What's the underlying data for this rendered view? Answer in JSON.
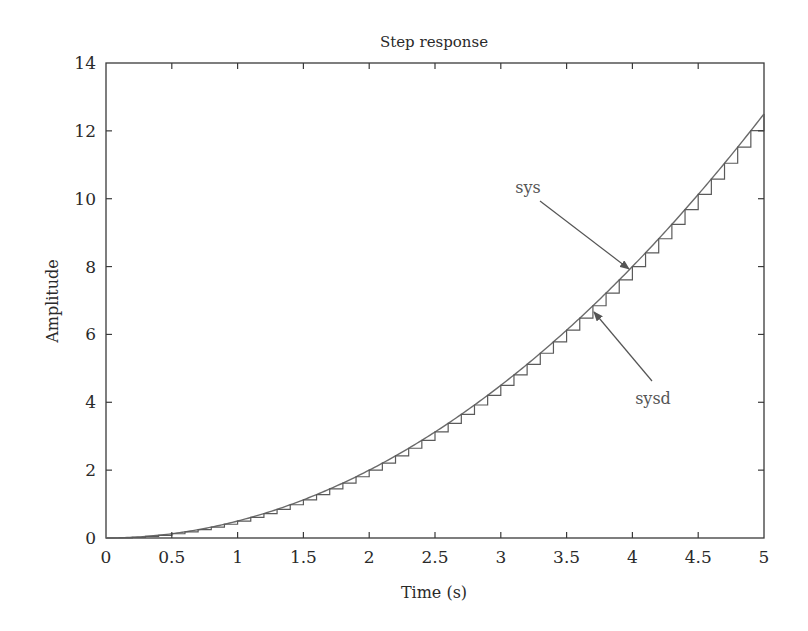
{
  "chart_data": {
    "type": "line",
    "title": "Step response",
    "xlabel": "Time (s)",
    "ylabel": "Amplitude",
    "xlim": [
      0,
      5
    ],
    "ylim": [
      0,
      14
    ],
    "xticks": [
      0,
      0.5,
      1,
      1.5,
      2,
      2.5,
      3,
      3.5,
      4,
      4.5,
      5
    ],
    "xtick_labels": [
      "0",
      "0.5",
      "1",
      "1.5",
      "2",
      "2.5",
      "3",
      "3.5",
      "4",
      "4.5",
      "5"
    ],
    "yticks": [
      0,
      2,
      4,
      6,
      8,
      10,
      12,
      14
    ],
    "ytick_labels": [
      "0",
      "2",
      "4",
      "6",
      "8",
      "10",
      "12",
      "14"
    ],
    "grid": false,
    "legend": "none",
    "series": [
      {
        "name": "sys",
        "style": "continuous",
        "formula_note": "approximately 0.5*t^2",
        "x": [
          0,
          0.5,
          1,
          1.5,
          2,
          2.5,
          3,
          3.5,
          4,
          4.5,
          5
        ],
        "values": [
          0,
          0.125,
          0.5,
          1.125,
          2,
          3.125,
          4.5,
          6.125,
          8,
          10.125,
          12.5
        ]
      },
      {
        "name": "sysd",
        "style": "stairs",
        "sample_time": 0.1,
        "x": [
          0,
          0.5,
          1,
          1.5,
          2,
          2.5,
          3,
          3.5,
          4,
          4.5,
          5
        ],
        "values": [
          0,
          0.125,
          0.5,
          1.125,
          2,
          3.125,
          4.5,
          6.125,
          8,
          10.125,
          12.5
        ]
      }
    ],
    "annotations": [
      {
        "text": "sys",
        "label_xy_px": [
          528,
          193
        ],
        "arrow_from_px": [
          540,
          201
        ],
        "arrow_to_px": [
          629,
          269
        ]
      },
      {
        "text": "sysd",
        "label_xy_px": [
          653,
          404
        ],
        "arrow_from_px": [
          652,
          381
        ],
        "arrow_to_px": [
          594,
          312
        ]
      }
    ]
  },
  "colors": {
    "axis": "#3a3a3a",
    "curve": "#6a6a6a",
    "stairs": "#5a5a5a",
    "arrow": "#555555"
  }
}
